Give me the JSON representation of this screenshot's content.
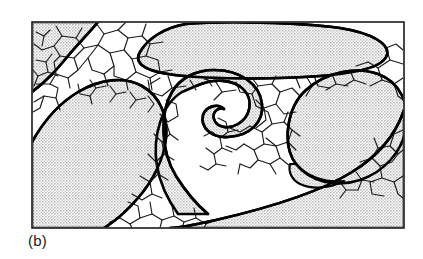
{
  "figure": {
    "caption": "(b)",
    "frame": {
      "x": 32,
      "y": 22,
      "width": 372,
      "height": 206,
      "stroke_color": "#1a1a1a",
      "stroke_width": 1.6
    },
    "colors": {
      "background": "#ffffff",
      "phase_fill": "#d9d9d9",
      "matrix_fill": "#ffffff",
      "grain_boundary": "#1a1a1a",
      "phase_outline": "#000000",
      "caption_text": "#1a1a1a"
    },
    "line_widths": {
      "grain_boundary": 1.15,
      "phase_outline": 2.6,
      "frame": 1.6
    },
    "regions": [
      {
        "name": "top-left-wedge-phase",
        "kind": "second-phase",
        "fill": "#d9d9d9"
      },
      {
        "name": "upper-lens-phase",
        "kind": "second-phase",
        "fill": "#d9d9d9"
      },
      {
        "name": "left-large-blob-phase",
        "kind": "second-phase",
        "fill": "#d9d9d9"
      },
      {
        "name": "central-hook-phase",
        "kind": "second-phase",
        "fill": "#d9d9d9"
      },
      {
        "name": "right-oval-phase",
        "kind": "second-phase",
        "fill": "#d9d9d9"
      },
      {
        "name": "bottom-band-phase",
        "kind": "second-phase",
        "fill": "#d9d9d9"
      },
      {
        "name": "fine-grain-matrix",
        "kind": "matrix",
        "fill": "#ffffff"
      }
    ]
  }
}
